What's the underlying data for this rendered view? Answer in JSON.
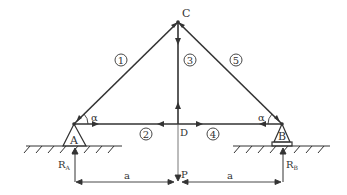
{
  "diagram": {
    "type": "truss",
    "colors": {
      "stroke": "#333333",
      "background": "#ffffff"
    },
    "nodes": {
      "C": {
        "label": "C"
      },
      "A": {
        "label": "A"
      },
      "B": {
        "label": "B"
      },
      "D": {
        "label": "D"
      },
      "P": {
        "label": "P"
      }
    },
    "members": [
      {
        "id": "1",
        "label": "1",
        "from": "A",
        "to": "C"
      },
      {
        "id": "2",
        "label": "2",
        "from": "A",
        "to": "D"
      },
      {
        "id": "3",
        "label": "3",
        "from": "D",
        "to": "C"
      },
      {
        "id": "4",
        "label": "4",
        "from": "D",
        "to": "B"
      },
      {
        "id": "5",
        "label": "5",
        "from": "B",
        "to": "C"
      }
    ],
    "angles": {
      "left": "α",
      "right": "α"
    },
    "reactions": {
      "RA": {
        "main": "R",
        "sub": "A"
      },
      "RB": {
        "main": "R",
        "sub": "B"
      }
    },
    "dimensions": {
      "left": "a",
      "right": "a"
    },
    "load": {
      "label": "P"
    }
  }
}
